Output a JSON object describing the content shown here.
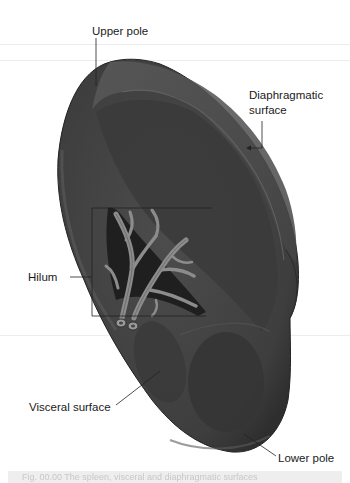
{
  "figure": {
    "subject": "Spleen",
    "labels": {
      "upper_pole": "Upper pole",
      "diaphragmatic_surface_line1": "Diaphragmatic",
      "diaphragmatic_surface_line2": "surface",
      "hilum": "Hilum",
      "visceral_surface": "Visceral surface",
      "lower_pole": "Lower pole"
    },
    "colors": {
      "organ": "#4a4a4a",
      "organ_dark": "#3a3a3a",
      "organ_highlight": "#6e6e6e",
      "vessel": "#8a8a8a",
      "leader_line": "#222222",
      "caption_bg": "#eeeeee"
    }
  },
  "caption": {
    "text": "Fig. 00.00  The spleen, visceral and diaphragmatic surfaces"
  }
}
